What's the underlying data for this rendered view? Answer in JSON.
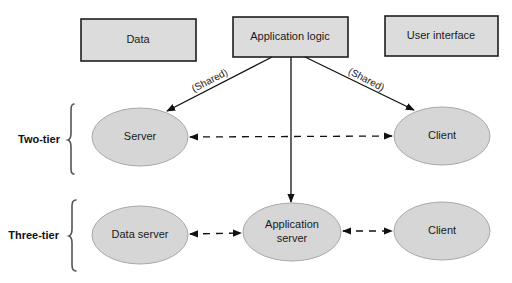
{
  "diagram": {
    "top_boxes": [
      {
        "id": "data",
        "label": "Data"
      },
      {
        "id": "app_logic",
        "label": "Application logic"
      },
      {
        "id": "ui",
        "label": "User interface"
      }
    ],
    "edge_labels": {
      "shared_left": "(Shared)",
      "shared_right": "(Shared)"
    },
    "tiers": [
      {
        "label": "Two-tier",
        "nodes": [
          {
            "id": "server",
            "label": "Server"
          },
          {
            "id": "client2",
            "label": "Client"
          }
        ]
      },
      {
        "label": "Three-tier",
        "nodes": [
          {
            "id": "data_server",
            "label": "Data server"
          },
          {
            "id": "app_server",
            "label_line1": "Application",
            "label_line2": "server"
          },
          {
            "id": "client3",
            "label": "Client"
          }
        ]
      }
    ],
    "edges": [
      {
        "from": "Application logic",
        "to": "Server",
        "style": "solid",
        "label": "(Shared)"
      },
      {
        "from": "Application logic",
        "to": "Client (two-tier)",
        "style": "solid",
        "label": "(Shared)"
      },
      {
        "from": "Application logic",
        "to": "Application server",
        "style": "solid"
      },
      {
        "from": "Server",
        "to": "Client (two-tier)",
        "style": "dashed",
        "bidirectional": true
      },
      {
        "from": "Data server",
        "to": "Application server",
        "style": "dashed",
        "bidirectional": true
      },
      {
        "from": "Application server",
        "to": "Client (three-tier)",
        "style": "dashed",
        "bidirectional": true
      }
    ],
    "colors": {
      "box_fill": "#dcdcdc",
      "ellipse_fill": "#d6d6d6",
      "stroke": "#1e1e1e"
    }
  }
}
